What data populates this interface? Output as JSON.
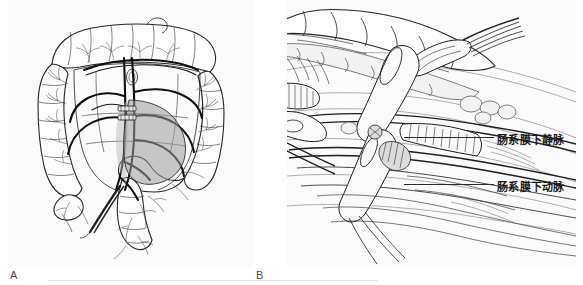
{
  "figure": {
    "type": "surgical-anatomy-illustration",
    "background_color": "#ffffff",
    "panel_background": "#fbfbfb",
    "width": 583,
    "height": 285
  },
  "panels": [
    {
      "id": "A",
      "label": "A",
      "subject": "colon-with-mesenteric-vasculature-and-resection-margin",
      "description": "Line drawing of the large bowel showing the colon frame, mesenteric vessel arcades and a shaded segment marking the planned resection with vessel ligation clips"
    },
    {
      "id": "B",
      "label": "B",
      "subject": "laparoscopic-dissection-of-inferior-mesenteric-vessels",
      "description": "Close-up operative view with laparoscopic graspers dissecting the retroperitoneal plane, exposing the inferior mesenteric vein and artery"
    }
  ],
  "callouts": [
    {
      "id": "imv",
      "text": "肠系膜下静脉",
      "meaning": "inferior-mesenteric-vein",
      "leader_line": true
    },
    {
      "id": "ima",
      "text": "肠系膜下动脉",
      "meaning": "inferior-mesenteric-artery",
      "leader_line": true
    }
  ],
  "colors": {
    "ink": "#1d1d1d",
    "label_text": "#4a4a4a",
    "callout_text": "#1a1a1a",
    "leader": "#2b2b2b",
    "shade": "#9a9a9a",
    "baseline": "#e3e3e3"
  }
}
